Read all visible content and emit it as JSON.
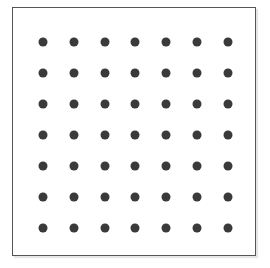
{
  "grid": {
    "rows": 7,
    "cols": 7,
    "dot_color": "#3a3a3a",
    "origin": [
      42,
      41
    ],
    "spacing": [
      30.8,
      31.0
    ]
  }
}
